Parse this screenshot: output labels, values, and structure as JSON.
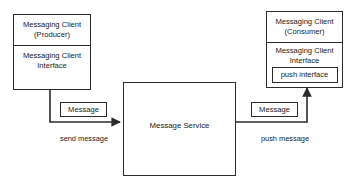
{
  "diagram": {
    "background_color": "#ffffff",
    "stroke_color": "#2b2b2b",
    "text_color": "#1a1a1a",
    "nodes": {
      "producer": {
        "header_line_1": "Messaging Client",
        "header_line_2": "(Producer)",
        "body_line_1": "Messaging Client",
        "body_line_2": "Interface"
      },
      "consumer": {
        "header_line_1": "Messaging Client",
        "header_line_2": "(Consumer)",
        "body_line_1": "Messaging Client",
        "body_line_2": "Interface",
        "inner_box_label": "push interface"
      },
      "service": {
        "label": "Message Service"
      }
    },
    "edges": {
      "send": {
        "tag_label": "Message",
        "caption": "send message"
      },
      "push": {
        "tag_label": "Message",
        "caption": "push message"
      }
    }
  }
}
